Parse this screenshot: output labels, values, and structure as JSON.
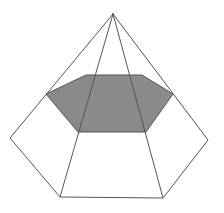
{
  "figure": {
    "colors": {
      "stroke": "#555555",
      "fill": "#8a8a8a",
      "background": "#ffffff"
    },
    "apex": [
      113,
      14
    ],
    "base": [
      [
        10,
        138
      ],
      [
        60,
        197
      ],
      [
        163,
        198
      ],
      [
        208,
        140
      ]
    ],
    "section": [
      [
        46,
        94
      ],
      [
        86,
        75
      ],
      [
        142,
        75
      ],
      [
        173,
        94
      ],
      [
        146,
        132
      ],
      [
        78,
        132
      ]
    ]
  }
}
